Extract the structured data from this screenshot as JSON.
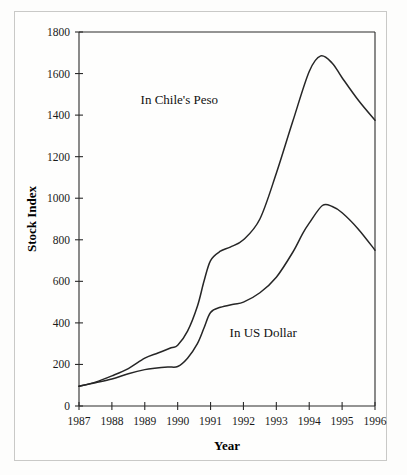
{
  "figure": {
    "background_color": "#fdfdfc",
    "frame_color": "#c9c9c7",
    "line_color": "#262626",
    "text_color": "#111111"
  },
  "chart_data": {
    "type": "line",
    "title": "",
    "xlabel": "Year",
    "ylabel": "Stock Index",
    "xlim": [
      1987,
      1996
    ],
    "ylim": [
      0,
      1800
    ],
    "grid": false,
    "legend_position": "inline-annotations",
    "x": [
      1987,
      1988,
      1989,
      1990,
      1991,
      1992,
      1993,
      1994,
      1995,
      1996
    ],
    "xticklabels": [
      "1987",
      "1988",
      "1989",
      "1990",
      "1991",
      "1992",
      "1993",
      "1994",
      "1995",
      "1996"
    ],
    "yticks": [
      0,
      200,
      400,
      600,
      800,
      1000,
      1200,
      1400,
      1600,
      1800
    ],
    "yticklabels": [
      "0",
      "200",
      "400",
      "600",
      "800",
      "1000",
      "1200",
      "1400",
      "1600",
      "1800"
    ],
    "series": [
      {
        "name": "In Chile's Peso",
        "label_x": 1990.05,
        "label_y": 1455,
        "values": [
          95,
          140,
          230,
          290,
          700,
          800,
          1120,
          1620,
          1600,
          1375
        ],
        "dense_x": [
          1987.0,
          1987.5,
          1988.0,
          1988.5,
          1989.0,
          1989.4,
          1989.8,
          1990.0,
          1990.3,
          1990.6,
          1990.8,
          1991.0,
          1991.3,
          1991.6,
          1992.0,
          1992.5,
          1993.0,
          1993.5,
          1994.0,
          1994.35,
          1994.7,
          1995.0,
          1995.5,
          1996.0
        ],
        "dense_y": [
          95,
          115,
          145,
          180,
          230,
          255,
          280,
          292,
          360,
          480,
          600,
          700,
          745,
          765,
          800,
          900,
          1120,
          1370,
          1610,
          1685,
          1650,
          1580,
          1470,
          1375
        ]
      },
      {
        "name": "In US Dollar",
        "label_x": 1992.6,
        "label_y": 330,
        "values": [
          95,
          130,
          175,
          190,
          450,
          500,
          620,
          920,
          900,
          750
        ],
        "dense_x": [
          1987.0,
          1987.5,
          1988.0,
          1988.5,
          1989.0,
          1989.3,
          1989.7,
          1990.0,
          1990.3,
          1990.6,
          1990.8,
          1991.0,
          1991.3,
          1991.7,
          1992.0,
          1992.5,
          1993.0,
          1993.5,
          1993.8,
          1994.0,
          1994.4,
          1994.7,
          1995.0,
          1995.5,
          1996.0
        ],
        "dense_y": [
          95,
          112,
          130,
          155,
          175,
          182,
          188,
          190,
          230,
          300,
          375,
          450,
          475,
          490,
          500,
          545,
          620,
          740,
          830,
          880,
          965,
          960,
          930,
          850,
          750
        ]
      }
    ]
  }
}
